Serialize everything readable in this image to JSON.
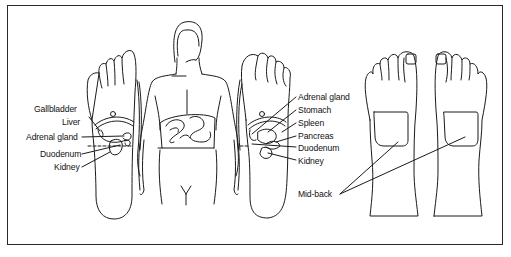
{
  "figure": {
    "stroke_color": "#1a1a1a",
    "background_color": "#ffffff"
  },
  "left_foot": {
    "labels": [
      {
        "id": "gallbladder",
        "text": "Gallbladder"
      },
      {
        "id": "liver",
        "text": "Liver"
      },
      {
        "id": "adrenal-gland",
        "text": "Adrenal gland"
      },
      {
        "id": "duodenum",
        "text": "Duodenum"
      },
      {
        "id": "kidney",
        "text": "Kidney"
      }
    ]
  },
  "right_foot": {
    "labels": [
      {
        "id": "adrenal-gland",
        "text": "Adrenal gland"
      },
      {
        "id": "stomach",
        "text": "Stomach"
      },
      {
        "id": "spleen",
        "text": "Spleen"
      },
      {
        "id": "pancreas",
        "text": "Pancreas"
      },
      {
        "id": "duodenum",
        "text": "Duodenum"
      },
      {
        "id": "kidney",
        "text": "Kidney"
      }
    ]
  },
  "back_feet": {
    "label": "Mid-back"
  }
}
